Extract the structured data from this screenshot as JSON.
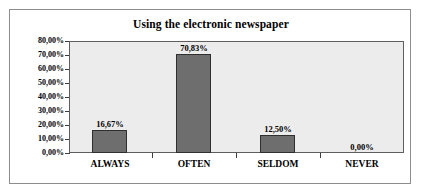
{
  "chart_data": {
    "type": "bar",
    "title": "Using the electronic newspaper",
    "xlabel": "",
    "ylabel": "",
    "categories": [
      "ALWAYS",
      "OFTEN",
      "SELDOM",
      "NEVER"
    ],
    "values": [
      16.67,
      70.83,
      12.5,
      0.0
    ],
    "value_labels": [
      "16,67%",
      "70,83%",
      "12,50%",
      "0,00%"
    ],
    "ylim": [
      0,
      80
    ],
    "ytick_values": [
      0,
      10,
      20,
      30,
      40,
      50,
      60,
      70,
      80
    ],
    "ytick_labels": [
      "0,00%",
      "10,00%",
      "20,00%",
      "30,00%",
      "40,00%",
      "50,00%",
      "60,00%",
      "70,00%",
      "80,00%"
    ],
    "grid": false,
    "legend": false,
    "series": [
      {
        "name": "Using the electronic newspaper",
        "values": [
          16.67,
          70.83,
          12.5,
          0.0
        ]
      }
    ],
    "colors": {
      "bar_fill": "#6e6e6e",
      "bar_border": "#2f2f2f",
      "plot_background": "#ececec",
      "plot_border": "#5e5e5e",
      "frame_border": "#8d8d8d",
      "text": "#000000",
      "page_background": "#ffffff"
    }
  }
}
